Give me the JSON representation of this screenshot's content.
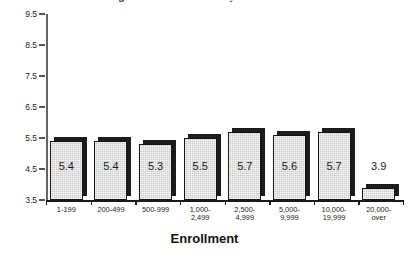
{
  "chart_data": {
    "type": "bar",
    "title": "Average Number of Advisees by Size of Institution",
    "xlabel": "Enrollment",
    "ylabel": "",
    "ylim": [
      3.5,
      9.5
    ],
    "yticks": [
      "9.5",
      "8.5",
      "7.5",
      "6.5",
      "5.5",
      "4.5",
      "3.5"
    ],
    "grid": false,
    "legend": null,
    "categories": [
      {
        "line1": "1-199",
        "line2": ""
      },
      {
        "line1": "200-499",
        "line2": ""
      },
      {
        "line1": "500-999",
        "line2": ""
      },
      {
        "line1": "1,000-",
        "line2": "2,499"
      },
      {
        "line1": "2,500-",
        "line2": "4,999"
      },
      {
        "line1": "5,000-",
        "line2": "9,999"
      },
      {
        "line1": "10,000-",
        "line2": "19,999"
      },
      {
        "line1": "20,000-",
        "line2": "over"
      }
    ],
    "values": [
      5.4,
      5.4,
      5.3,
      5.5,
      5.7,
      5.6,
      5.7,
      3.9
    ],
    "value_labels": [
      "5.4",
      "5.4",
      "5.3",
      "5.5",
      "5.7",
      "5.6",
      "5.7",
      "3.9"
    ],
    "colors": {
      "bar_face": "#c9c9c9",
      "bar_outline": "#141414",
      "bar_shadow": "#1c1c1c",
      "axis": "#1a1a1a",
      "text": "#111111",
      "background": "#ffffff"
    }
  }
}
